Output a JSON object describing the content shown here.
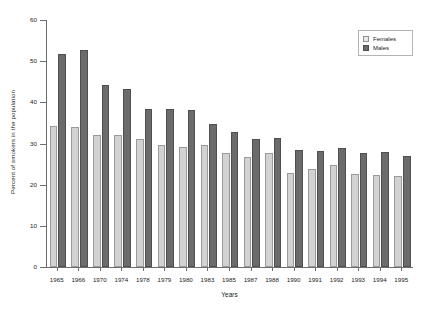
{
  "chart_data": {
    "type": "bar",
    "title": "",
    "subtitle": "",
    "xlabel": "Years",
    "ylabel": "Percent of smokers in the population",
    "categories": [
      "1965",
      "1966",
      "1970",
      "1974",
      "1978",
      "1979",
      "1980",
      "1983",
      "1985",
      "1987",
      "1988",
      "1990",
      "1991",
      "1992",
      "1993",
      "1994",
      "1995"
    ],
    "series": [
      {
        "name": "Females",
        "color": "#d2d2d2",
        "values": [
          34.2,
          34.0,
          32.0,
          32.0,
          31.2,
          29.7,
          29.1,
          29.7,
          27.8,
          26.8,
          27.6,
          22.9,
          23.7,
          24.7,
          22.6,
          22.3,
          22.2
        ]
      },
      {
        "name": "Males",
        "color": "#6b6b6b",
        "values": [
          51.8,
          52.8,
          44.1,
          43.2,
          38.3,
          38.4,
          38.2,
          34.7,
          32.7,
          31.0,
          31.3,
          28.4,
          28.2,
          28.8,
          27.8,
          27.9,
          26.9
        ]
      }
    ],
    "ylim": [
      0,
      60
    ],
    "yticks": [
      0,
      10,
      20,
      30,
      40,
      50,
      60
    ],
    "ytick_labels": [
      "0",
      "10",
      "20",
      "30",
      "40",
      "50",
      "60"
    ],
    "grid": false,
    "legend_position": "top-right",
    "legend_entries": [
      "Females",
      "Males"
    ]
  }
}
